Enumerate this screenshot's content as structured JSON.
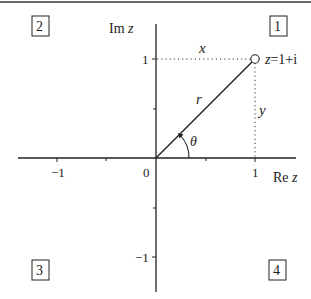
{
  "figure": {
    "axes": {
      "real_label_prefix": "Re",
      "real_label_var": "z",
      "imag_label_prefix": "Im",
      "imag_label_var": "z",
      "origin_label": "0",
      "x_ticks": [
        {
          "value": -1,
          "label": "−1"
        },
        {
          "value": 1,
          "label": "1"
        }
      ],
      "y_ticks": [
        {
          "value": 1,
          "label": "1"
        },
        {
          "value": -1,
          "label": "−1"
        }
      ]
    },
    "point": {
      "label": "z=1+i",
      "label_var": "z",
      "label_rest": "=1+i",
      "re": 1,
      "im": 1
    },
    "annotations": {
      "x_label": "x",
      "y_label": "y",
      "r_label": "r",
      "theta_label": "θ"
    },
    "quadrants": [
      {
        "id": 1,
        "label": "1"
      },
      {
        "id": 2,
        "label": "2"
      },
      {
        "id": 3,
        "label": "3"
      },
      {
        "id": 4,
        "label": "4"
      }
    ],
    "colors": {
      "ink": "#222222",
      "background": "#ffffff"
    }
  }
}
